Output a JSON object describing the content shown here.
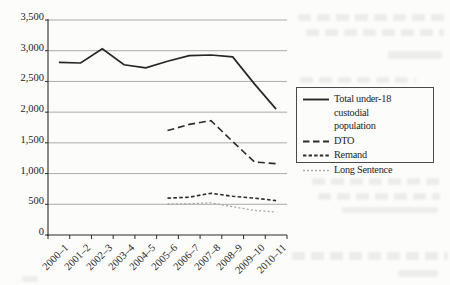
{
  "chart_data": {
    "type": "line",
    "title": "",
    "xlabel": "",
    "ylabel": "",
    "grid": "horizontal",
    "legend_position": "right",
    "ylim": [
      0,
      3500
    ],
    "categories": [
      "2000–1",
      "2001–2",
      "2002–3",
      "2003–4",
      "2004–5",
      "2005–6",
      "2006–7",
      "2007–8",
      "2008–9",
      "2009–10",
      "2010–11"
    ],
    "yticks": [
      {
        "value": 0,
        "label": "0"
      },
      {
        "value": 500,
        "label": "500"
      },
      {
        "value": 1000,
        "label": "1,000"
      },
      {
        "value": 1500,
        "label": "1,500"
      },
      {
        "value": 2000,
        "label": "2,000"
      },
      {
        "value": 2500,
        "label": "2,500"
      },
      {
        "value": 3000,
        "label": "3,000"
      },
      {
        "value": 3500,
        "label": "3,500"
      }
    ],
    "series": [
      {
        "id": "total",
        "name": "Total under-18 custodial population",
        "values": [
          2810,
          2800,
          3030,
          2770,
          2720,
          2830,
          2920,
          2930,
          2900,
          2460,
          2050
        ],
        "color": "#262626",
        "dash": "",
        "width": 1.7
      },
      {
        "id": "dto",
        "name": "DTO",
        "values": [
          null,
          null,
          null,
          null,
          null,
          1700,
          1800,
          1860,
          1520,
          1190,
          1160
        ],
        "color": "#2c2c2c",
        "dash": "7 3.8",
        "width": 1.6
      },
      {
        "id": "remand",
        "name": "Remand",
        "values": [
          null,
          null,
          null,
          null,
          null,
          600,
          615,
          680,
          630,
          600,
          560
        ],
        "color": "#2c2c2c",
        "dash": "3.6 2.3",
        "width": 1.6
      },
      {
        "id": "long-sentence",
        "name": "Long Sentence",
        "values": [
          null,
          null,
          null,
          null,
          null,
          505,
          510,
          525,
          460,
          400,
          375
        ],
        "color": "#a7a7a7",
        "dash": "2 2.2",
        "width": 1.3
      }
    ]
  },
  "legend": {
    "items": [
      {
        "id": "total",
        "label": "Total under-18 custodial\npopulation",
        "color": "#262626",
        "dash": "",
        "sw": 1.9
      },
      {
        "id": "dto",
        "label": "DTO",
        "color": "#2c2c2c",
        "dash": "6.5 3.5",
        "sw": 1.8
      },
      {
        "id": "remand",
        "label": "Remand",
        "color": "#2c2c2c",
        "dash": "3.4 2.2",
        "sw": 1.8
      },
      {
        "id": "long-sentence",
        "label": "Long Sentence",
        "color": "#a7a7a7",
        "dash": "1.9 2.1",
        "sw": 1.4
      }
    ]
  },
  "colors": {
    "gridline": "#a2a2a2",
    "axis": "#2a2a2a",
    "text": "#222222",
    "paper": "#fcfcfb"
  }
}
